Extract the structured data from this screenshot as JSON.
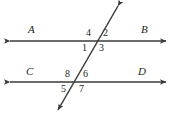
{
  "figure": {
    "stroke_color": "#3a3a3a",
    "label_color": "#231f20",
    "background": "#ffffff",
    "line_labels": [
      {
        "text": "A",
        "name": "line-label-a",
        "x": 28,
        "y": 24
      },
      {
        "text": "B",
        "name": "line-label-b",
        "x": 141,
        "y": 24
      },
      {
        "text": "C",
        "name": "line-label-c",
        "x": 26,
        "y": 66
      },
      {
        "text": "D",
        "name": "line-label-d",
        "x": 138,
        "y": 66
      }
    ],
    "angle_labels": [
      {
        "text": "4",
        "name": "angle-label-4",
        "x": 86,
        "y": 28
      },
      {
        "text": "2",
        "name": "angle-label-2",
        "x": 103,
        "y": 28
      },
      {
        "text": "1",
        "name": "angle-label-1",
        "x": 82,
        "y": 43
      },
      {
        "text": "3",
        "name": "angle-label-3",
        "x": 99,
        "y": 43
      },
      {
        "text": "8",
        "name": "angle-label-8",
        "x": 65,
        "y": 69
      },
      {
        "text": "6",
        "name": "angle-label-6",
        "x": 83,
        "y": 69
      },
      {
        "text": "5",
        "name": "angle-label-5",
        "x": 61,
        "y": 84
      },
      {
        "text": "7",
        "name": "angle-label-7",
        "x": 79,
        "y": 84
      }
    ],
    "lines": {
      "top_parallel": {
        "name": "line-ab",
        "x1": 10,
        "y1": 41,
        "x2": 166,
        "y2": 41
      },
      "bottom_parallel": {
        "name": "line-cd",
        "x1": 10,
        "y1": 82,
        "x2": 166,
        "y2": 82
      },
      "transversal": {
        "name": "transversal-line",
        "x1": 118,
        "y1": 6,
        "x2": 58,
        "y2": 110
      }
    },
    "intersections": [
      {
        "name": "intersection-top",
        "x": 98,
        "y": 41
      },
      {
        "name": "intersection-bottom",
        "x": 78,
        "y": 82
      }
    ]
  }
}
